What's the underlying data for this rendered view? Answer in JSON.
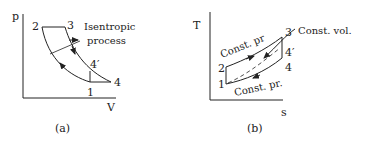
{
  "figure_a": {
    "caption": "(a)",
    "y_axis_label": "p",
    "x_axis_label": "V",
    "points": {
      "p1": "1",
      "p2": "2",
      "p3": "3",
      "p4": "4",
      "p4prime": "4′"
    },
    "annotation_line1": "Isentropic",
    "annotation_line2": "process"
  },
  "figure_b": {
    "caption": "(b)",
    "y_axis_label": "T",
    "x_axis_label": "s",
    "points": {
      "p1": "1",
      "p2": "2",
      "p3": "3",
      "p4": "4",
      "p4prime": "4′"
    },
    "label_const_pr_top": "Const. pr",
    "label_const_pr_bottom": "Const. pr.",
    "label_const_vol": "Const. vol."
  },
  "colors": {
    "line": "#222222",
    "background": "#ffffff"
  }
}
